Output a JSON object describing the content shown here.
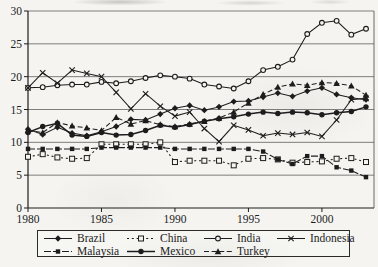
{
  "figure": {
    "background": "#f5f4f1",
    "ink": "#1c1c1c",
    "grid_color": "#4a4a4a"
  },
  "chart_data": {
    "type": "line",
    "title": "",
    "xlabel": "",
    "ylabel": "",
    "x": [
      1980,
      1981,
      1982,
      1983,
      1984,
      1985,
      1986,
      1987,
      1988,
      1989,
      1990,
      1991,
      1992,
      1993,
      1994,
      1995,
      1996,
      1997,
      1998,
      1999,
      2000,
      2001,
      2002,
      2003
    ],
    "xticks": [
      1980,
      1985,
      1990,
      1995,
      2000
    ],
    "yticks": [
      0,
      5,
      10,
      15,
      20,
      25,
      30
    ],
    "xlim": [
      1980,
      2003.6
    ],
    "ylim": [
      0,
      30
    ],
    "grid": "horizontal",
    "legend_position": "bottom-box",
    "series": [
      {
        "name": "Brazil",
        "marker": "filled-diamond",
        "line": "solid",
        "values": [
          12.0,
          11.2,
          12.3,
          11.4,
          11.0,
          11.6,
          12.4,
          13.5,
          13.4,
          14.3,
          15.2,
          15.6,
          14.9,
          15.4,
          16.2,
          16.3,
          16.9,
          17.5,
          17.0,
          17.8,
          18.3,
          17.3,
          16.8,
          16.5
        ]
      },
      {
        "name": "China",
        "marker": "open-square",
        "line": "dashed",
        "values": [
          7.8,
          8.2,
          7.7,
          7.5,
          7.6,
          9.7,
          9.7,
          9.7,
          9.7,
          10.0,
          7.0,
          7.2,
          7.2,
          7.2,
          6.5,
          7.5,
          7.6,
          7.4,
          6.9,
          7.0,
          7.1,
          7.5,
          7.6,
          7.0
        ]
      },
      {
        "name": "India",
        "marker": "open-circle",
        "line": "solid",
        "values": [
          18.3,
          18.4,
          18.7,
          18.8,
          18.8,
          19.2,
          19.0,
          19.3,
          19.8,
          20.2,
          20.0,
          19.7,
          18.8,
          18.5,
          18.2,
          19.3,
          21.0,
          21.5,
          22.6,
          26.5,
          28.2,
          28.5,
          26.4,
          27.3
        ]
      },
      {
        "name": "Indonesia",
        "marker": "x-cross",
        "line": "solid",
        "values": [
          18.3,
          20.6,
          19.0,
          21.0,
          20.5,
          20.0,
          17.6,
          15.1,
          17.4,
          15.5,
          14.0,
          14.6,
          12.1,
          10.1,
          12.6,
          11.9,
          11.0,
          11.4,
          11.2,
          11.5,
          10.9,
          13.4,
          16.5,
          16.7
        ]
      },
      {
        "name": "Malaysia",
        "marker": "filled-square",
        "line": "long-dash",
        "values": [
          9.0,
          9.0,
          9.0,
          9.0,
          9.0,
          9.2,
          9.2,
          9.2,
          9.2,
          9.2,
          9.0,
          9.0,
          9.0,
          9.0,
          9.0,
          9.0,
          8.6,
          7.4,
          6.7,
          7.9,
          7.9,
          6.2,
          5.7,
          4.7
        ]
      },
      {
        "name": "Mexico",
        "marker": "filled-circle",
        "line": "solid-bold",
        "values": [
          11.5,
          12.4,
          12.9,
          11.1,
          10.9,
          11.5,
          11.1,
          11.2,
          11.8,
          12.6,
          12.3,
          12.7,
          13.2,
          13.6,
          13.9,
          14.3,
          14.6,
          14.4,
          14.6,
          14.5,
          14.2,
          14.5,
          14.7,
          15.4
        ]
      },
      {
        "name": "Turkey",
        "marker": "filled-triangle",
        "line": "dashed",
        "values": [
          11.8,
          11.5,
          13.0,
          12.5,
          12.2,
          11.8,
          13.8,
          12.8,
          13.3,
          12.7,
          12.4,
          12.8,
          13.2,
          13.7,
          14.6,
          16.0,
          17.3,
          18.4,
          18.9,
          18.7,
          19.1,
          19.0,
          18.6,
          17.2
        ]
      }
    ]
  }
}
